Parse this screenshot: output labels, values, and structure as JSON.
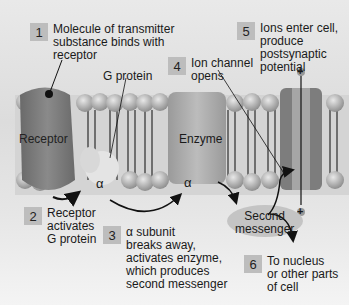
{
  "diagram": {
    "steps": [
      {
        "num": "1",
        "text": "Molecule of transmitter\nsubstance binds with\nreceptor"
      },
      {
        "num": "2",
        "text": "Receptor\nactivates\nG protein"
      },
      {
        "num": "3",
        "text": "α subunit\nbreaks away,\nactivates enzyme,\nwhich produces\nsecond messenger"
      },
      {
        "num": "4",
        "text": "Ion channel\nopens"
      },
      {
        "num": "5",
        "text": "Ions enter cell,\nproduce\npostsynaptic\npotential"
      },
      {
        "num": "6",
        "text": "To nucleus\nor other parts\nof cell"
      }
    ],
    "labels": {
      "receptor": "Receptor",
      "g_protein": "G protein",
      "enzyme": "Enzyme",
      "second_messenger": "Second\nmessenger",
      "alpha": "α",
      "plus": "+"
    },
    "colors": {
      "receptor": "#7a7a7a",
      "enzyme": "#a9a9a9",
      "channel": "#8c8c8c",
      "lipid_head": "#b5b5b5",
      "step_box": "#bdbdbd"
    }
  }
}
